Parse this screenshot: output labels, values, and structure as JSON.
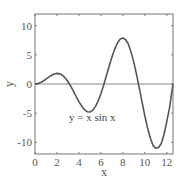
{
  "chart_data": {
    "type": "line",
    "title": "",
    "xlabel": "x",
    "ylabel": "y",
    "xlim": [
      0,
      12.566
    ],
    "ylim": [
      -12,
      12
    ],
    "grid": false,
    "xticks": [
      0,
      2,
      4,
      6,
      8,
      10,
      12
    ],
    "xtick_labels": [
      "0",
      "2",
      "4",
      "6",
      "8",
      "10",
      "12"
    ],
    "yticks": [
      10,
      5,
      0,
      -5,
      -10
    ],
    "ytick_labels": [
      "10",
      "5",
      "0",
      "-5",
      "-10"
    ],
    "annotation": {
      "text": "y = x sin x",
      "x": 3.0,
      "y": -6.2
    },
    "zero_line": true,
    "series": [
      {
        "name": "y = x sin x",
        "color": "#555555",
        "x": [
          0,
          0.25,
          0.5,
          0.75,
          1,
          1.25,
          1.5,
          1.75,
          2,
          2.25,
          2.5,
          2.75,
          3,
          3.25,
          3.5,
          3.75,
          4,
          4.25,
          4.5,
          4.75,
          5,
          5.25,
          5.5,
          5.75,
          6,
          6.25,
          6.5,
          6.75,
          7,
          7.25,
          7.5,
          7.75,
          8,
          8.25,
          8.5,
          8.75,
          9,
          9.25,
          9.5,
          9.75,
          10,
          10.25,
          10.5,
          10.75,
          11,
          11.25,
          11.5,
          11.75,
          12,
          12.25,
          12.5,
          12.566
        ],
        "y": [
          0,
          0.062,
          0.24,
          0.511,
          0.841,
          1.186,
          1.496,
          1.722,
          1.819,
          1.75,
          1.496,
          1.053,
          0.423,
          -0.352,
          -1.228,
          -2.143,
          -3.027,
          -3.789,
          -4.399,
          -4.749,
          -4.795,
          -4.512,
          -3.878,
          -2.918,
          -1.676,
          -0.208,
          1.402,
          3.027,
          4.599,
          5.945,
          7.035,
          7.66,
          7.915,
          7.586,
          6.848,
          5.459,
          3.709,
          1.583,
          -0.714,
          -3.095,
          -5.44,
          -7.553,
          -9.251,
          -10.555,
          -10.999,
          -10.88,
          -10.19,
          -8.609,
          -6.439,
          -4.102,
          -0.828,
          0
        ]
      }
    ]
  }
}
